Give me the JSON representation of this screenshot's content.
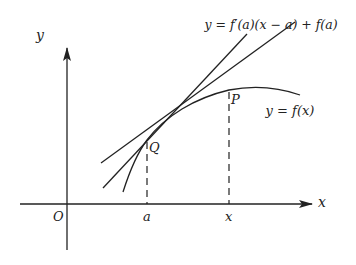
{
  "diagram": {
    "axes": {
      "x_label": "x",
      "y_label": "y",
      "origin_label": "O",
      "ticks": [
        {
          "label": "a",
          "meaning": "x-coordinate of Q"
        },
        {
          "label": "x",
          "meaning": "x-coordinate of P"
        }
      ]
    },
    "curve": {
      "label": "y = f(x)"
    },
    "tangent_line": {
      "label": "y = f′(a)(x − a) + f(a)"
    },
    "secant_line": {
      "through": [
        "Q",
        "P"
      ]
    },
    "points": [
      {
        "name": "Q",
        "label": "Q"
      },
      {
        "name": "P",
        "label": "P"
      }
    ],
    "colors": {
      "ink": "#222222",
      "background": "#ffffff"
    }
  }
}
